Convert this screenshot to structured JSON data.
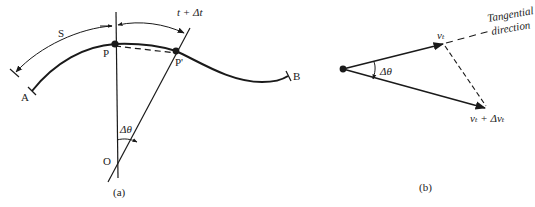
{
  "figure": {
    "panel_a": {
      "caption": "(a)",
      "labels": {
        "arc_length": "S",
        "point_p": "P",
        "point_p_prime": "P'",
        "point_a": "A",
        "point_b": "B",
        "center": "O",
        "angle": "Δθ",
        "time_label": "t + Δt"
      }
    },
    "panel_b": {
      "caption": "(b)",
      "labels": {
        "velocity": "vₜ",
        "velocity_new": "vₜ + Δvₜ",
        "angle": "Δθ",
        "tangential_line1": "Tangential",
        "tangential_line2": "direction"
      }
    },
    "colors": {
      "ink": "#1a1a1a",
      "background": "#ffffff"
    }
  }
}
